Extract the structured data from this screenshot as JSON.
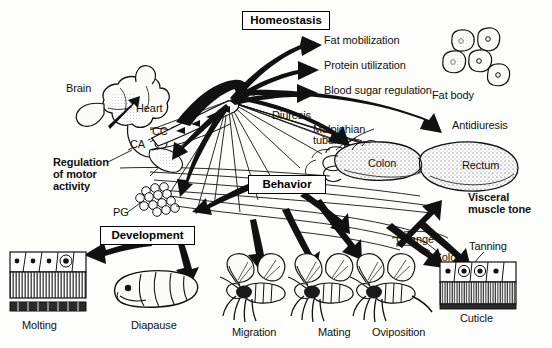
{
  "figure": {
    "ink_color": "#111111",
    "background_color": "#fdfdfb"
  },
  "boxes": [
    {
      "key": "homeostasis",
      "label": "Homeostasis"
    },
    {
      "key": "behavior",
      "label": "Behavior"
    },
    {
      "key": "development",
      "label": "Development"
    }
  ],
  "homeostasis_outputs": [
    {
      "key": "fat_mobilization",
      "label": "Fat mobilization"
    },
    {
      "key": "protein_utilization",
      "label": "Protein utilization"
    },
    {
      "key": "blood_sugar_regulation",
      "label": "Blood sugar regulation"
    }
  ],
  "anatomy": {
    "brain": "Brain",
    "heart": "Heart",
    "corpus_allatum": "CA",
    "corpus_cardiacum": "CC",
    "prothoracic_gland": "PG",
    "fat_body": "Fat body",
    "malpighian_tubules": "Malpighian\ntubules",
    "malpighian_line1": "Malpighian",
    "malpighian_line2": "tubules",
    "colon": "Colon",
    "rectum": "Rectum"
  },
  "effects": {
    "regulation_of_motor_activity_line1": "Regulation",
    "regulation_of_motor_activity_line2": "of motor",
    "regulation_of_motor_activity_line3": "activity",
    "diuresis": "Diuresis",
    "antidiuresis": "Antidiuresis",
    "visceral_muscle_tone_line1": "Visceral",
    "visceral_muscle_tone_line2": "muscle tone",
    "color": "Color",
    "change": "Change",
    "tanning": "Tanning"
  },
  "outcomes": [
    {
      "key": "molting",
      "label": "Molting"
    },
    {
      "key": "diapause",
      "label": "Diapause"
    },
    {
      "key": "migration",
      "label": "Migration"
    },
    {
      "key": "mating",
      "label": "Mating"
    },
    {
      "key": "oviposition",
      "label": "Oviposition"
    },
    {
      "key": "cuticle",
      "label": "Cuticle"
    }
  ]
}
